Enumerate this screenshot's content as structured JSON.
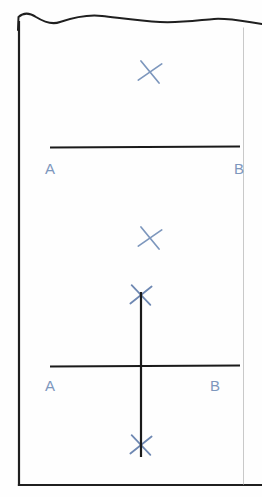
{
  "page": {
    "title": "Perpendicular Bisector Construction",
    "width": 262,
    "height": 497,
    "background_color": "#fefefe",
    "border": {
      "style": "torn-top-edge-rectangle",
      "stroke_color": "#1a1a1a",
      "left_x": 18,
      "right_x": 244,
      "bottom_y": 486,
      "top_wave_baseline_y": 16
    }
  },
  "ink": {
    "pencil_color": "#1a1a1a",
    "pen_color": "#7d97bd",
    "pen_color_dark": "#42567a"
  },
  "steps": [
    {
      "name": "step-one",
      "description": "Segment AB with a pair of intersecting arcs above it",
      "segment": {
        "label_a": "A",
        "label_b": "B",
        "x1": 50,
        "x2": 240,
        "y": 147,
        "label_a_x": 45,
        "label_a_y": 173,
        "label_b_x": 234,
        "label_b_y": 173
      },
      "marks": [
        {
          "name": "arc-intersection-top",
          "type": "cross",
          "cx": 150,
          "cy": 72,
          "size": 21,
          "rotation": 8
        }
      ]
    },
    {
      "name": "step-two",
      "description": "Segment AB crossed by the perpendicular bisector through two arc intersections",
      "segment": {
        "label_a": "A",
        "label_b": "B",
        "x1": 50,
        "x2": 240,
        "y": 366,
        "label_a_x": 45,
        "label_a_y": 390,
        "label_b_x": 210,
        "label_b_y": 390
      },
      "bisector": {
        "name": "perpendicular-bisector",
        "x": 141,
        "y1": 292,
        "y2": 457
      },
      "marks": [
        {
          "name": "arc-intersection-upper-free",
          "type": "cross",
          "cx": 150,
          "cy": 238,
          "size": 21,
          "rotation": 8
        },
        {
          "name": "arc-intersection-upper",
          "type": "cross",
          "cx": 141,
          "cy": 295,
          "size": 20,
          "rotation": 4
        },
        {
          "name": "arc-intersection-lower",
          "type": "cross",
          "cx": 141,
          "cy": 445,
          "size": 20,
          "rotation": 4
        }
      ]
    }
  ],
  "labels": {
    "a": "A",
    "b": "B"
  }
}
